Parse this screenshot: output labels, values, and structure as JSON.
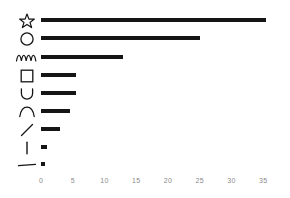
{
  "chart_data": {
    "type": "bar",
    "orientation": "horizontal",
    "title": "",
    "subtitle": "",
    "xlabel": "",
    "ylabel": "",
    "grid": false,
    "legend": null,
    "xlim": [
      0,
      36
    ],
    "xticks": [
      0,
      5,
      10,
      15,
      20,
      25,
      30,
      35
    ],
    "xticklabels": [
      "0",
      "5",
      "10",
      "15",
      "20",
      "25",
      "30",
      "35"
    ],
    "categories": [
      "star",
      "circle",
      "squiggle",
      "square",
      "u-curve",
      "arch",
      "diagonal-line",
      "vertical-line",
      "horizontal-line"
    ],
    "category_label_type": "glyph",
    "values": [
      35.4,
      25.0,
      12.9,
      5.5,
      5.5,
      4.6,
      3.0,
      1.0,
      0.6
    ],
    "bar_color": "#151515",
    "tick_label_color": "#8a8a8a",
    "background_color": "#ffffff"
  },
  "axis": {
    "ticks": [
      {
        "label": "0",
        "value": 0
      },
      {
        "label": "5",
        "value": 5
      },
      {
        "label": "10",
        "value": 10
      },
      {
        "label": "15",
        "value": 15
      },
      {
        "label": "20",
        "value": 20
      },
      {
        "label": "25",
        "value": 25
      },
      {
        "label": "30",
        "value": 30
      },
      {
        "label": "35",
        "value": 35
      }
    ]
  },
  "rows": [
    {
      "icon": "star-icon",
      "value": 35.4
    },
    {
      "icon": "circle-icon",
      "value": 25.0
    },
    {
      "icon": "squiggle-icon",
      "value": 12.9
    },
    {
      "icon": "square-icon",
      "value": 5.5
    },
    {
      "icon": "u-curve-icon",
      "value": 5.5
    },
    {
      "icon": "arch-icon",
      "value": 4.6
    },
    {
      "icon": "diagonal-line-icon",
      "value": 3.0
    },
    {
      "icon": "vertical-line-icon",
      "value": 1.0
    },
    {
      "icon": "horizontal-line-icon",
      "value": 0.6
    }
  ],
  "geometry": {
    "origin_x": 41,
    "px_per_unit": 6.35,
    "row_tops": [
      12,
      30,
      49,
      67,
      85,
      103,
      121,
      139,
      156
    ],
    "bar_thickness": 4
  }
}
